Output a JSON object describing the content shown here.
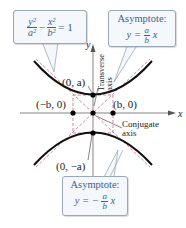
{
  "equation": {
    "lhs_term1_num": "y²",
    "lhs_term1_den": "a²",
    "minus": "−",
    "lhs_term2_num": "x²",
    "lhs_term2_den": "b²",
    "rhs": "= 1"
  },
  "asymptote_pos": {
    "title": "Asymptote:",
    "y_eq": "y =",
    "num": "a",
    "den": "b",
    "x": "x"
  },
  "asymptote_neg": {
    "title": "Asymptote:",
    "y_eq": "y = −",
    "num": "a",
    "den": "b",
    "x": "x"
  },
  "axes": {
    "x_label": "x",
    "y_label": "y"
  },
  "points": {
    "vertex_top": "(0, a)",
    "vertex_bottom": "(0, −a)",
    "co_vertex_left": "(−b, 0)",
    "co_vertex_right": "(b, 0)"
  },
  "axis_labels": {
    "transverse_line1": "Transverse",
    "transverse_line2": "axis",
    "conjugate_line1": "Conjugate",
    "conjugate_line2": "axis"
  },
  "colors": {
    "curve": "#111111",
    "asymptote": "#d9486a",
    "box_guide": "#d9486a",
    "callout_text": "#3d5f8f",
    "callout_border": "#9aa7b7",
    "callout_bg": "#f4f7fb"
  }
}
